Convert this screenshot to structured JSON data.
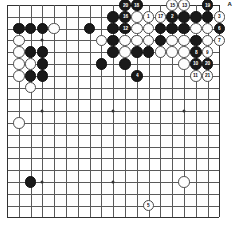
{
  "diagram": {
    "type": "go-board",
    "size": 19,
    "board_color": "#ffffff",
    "line_color": "#5a5a5a",
    "black_color": "#1a1a1a",
    "white_color": "#fdfdfd",
    "geometry": {
      "left": 7,
      "top": 5,
      "cell": 11.8,
      "stone_diameter": 11.6
    },
    "hoshi": [
      {
        "col": 3,
        "row": 3
      },
      {
        "col": 9,
        "row": 3
      },
      {
        "col": 15,
        "row": 3
      },
      {
        "col": 3,
        "row": 9
      },
      {
        "col": 9,
        "row": 9
      },
      {
        "col": 15,
        "row": 9
      },
      {
        "col": 3,
        "row": 15
      },
      {
        "col": 9,
        "row": 15
      },
      {
        "col": 15,
        "row": 15
      }
    ],
    "labels": [
      {
        "text": "A",
        "col": 18,
        "row": 0,
        "offset_x": 8,
        "offset_y": -1,
        "name": "point-label-a"
      }
    ],
    "stones": [
      {
        "col": 10,
        "row": 0,
        "color": "black",
        "number": "20"
      },
      {
        "col": 11,
        "row": 0,
        "color": "black",
        "number": "18"
      },
      {
        "col": 14,
        "row": 0,
        "color": "white",
        "number": "15"
      },
      {
        "col": 15,
        "row": 0,
        "color": "white",
        "number": "13"
      },
      {
        "col": 17,
        "row": 0,
        "color": "black",
        "number": "19"
      },
      {
        "col": 9,
        "row": 1,
        "color": "black",
        "number": ""
      },
      {
        "col": 10,
        "row": 1,
        "color": "black",
        "number": "16"
      },
      {
        "col": 11,
        "row": 1,
        "color": "white",
        "number": ""
      },
      {
        "col": 12,
        "row": 1,
        "color": "white",
        "number": "1"
      },
      {
        "col": 13,
        "row": 1,
        "color": "white",
        "number": "17"
      },
      {
        "col": 14,
        "row": 1,
        "color": "black",
        "number": "2"
      },
      {
        "col": 15,
        "row": 1,
        "color": "black",
        "number": ""
      },
      {
        "col": 16,
        "row": 1,
        "color": "black",
        "number": ""
      },
      {
        "col": 17,
        "row": 1,
        "color": "black",
        "number": ""
      },
      {
        "col": 18,
        "row": 1,
        "color": "white",
        "number": "3"
      },
      {
        "col": 9,
        "row": 2,
        "color": "black",
        "number": ""
      },
      {
        "col": 10,
        "row": 2,
        "color": "black",
        "number": "12"
      },
      {
        "col": 11,
        "row": 2,
        "color": "white",
        "number": ""
      },
      {
        "col": 12,
        "row": 2,
        "color": "white",
        "number": ""
      },
      {
        "col": 13,
        "row": 2,
        "color": "black",
        "number": ""
      },
      {
        "col": 14,
        "row": 2,
        "color": "black",
        "number": ""
      },
      {
        "col": 15,
        "row": 2,
        "color": "black",
        "number": ""
      },
      {
        "col": 16,
        "row": 2,
        "color": "white",
        "number": ""
      },
      {
        "col": 17,
        "row": 2,
        "color": "white",
        "number": ""
      },
      {
        "col": 18,
        "row": 2,
        "color": "black",
        "number": "6"
      },
      {
        "col": 8,
        "row": 3,
        "color": "white",
        "number": ""
      },
      {
        "col": 9,
        "row": 3,
        "color": "black",
        "number": ""
      },
      {
        "col": 10,
        "row": 3,
        "color": "white",
        "number": ""
      },
      {
        "col": 11,
        "row": 3,
        "color": "white",
        "number": ""
      },
      {
        "col": 12,
        "row": 3,
        "color": "white",
        "number": ""
      },
      {
        "col": 13,
        "row": 3,
        "color": "black",
        "number": ""
      },
      {
        "col": 14,
        "row": 3,
        "color": "white",
        "number": ""
      },
      {
        "col": 15,
        "row": 3,
        "color": "white",
        "number": ""
      },
      {
        "col": 16,
        "row": 3,
        "color": "black",
        "number": ""
      },
      {
        "col": 17,
        "row": 3,
        "color": "white",
        "number": ""
      },
      {
        "col": 18,
        "row": 3,
        "color": "white",
        "number": "7"
      },
      {
        "col": 9,
        "row": 4,
        "color": "black",
        "number": ""
      },
      {
        "col": 10,
        "row": 4,
        "color": "white",
        "number": ""
      },
      {
        "col": 11,
        "row": 4,
        "color": "black",
        "number": ""
      },
      {
        "col": 12,
        "row": 4,
        "color": "black",
        "number": ""
      },
      {
        "col": 13,
        "row": 4,
        "color": "white",
        "number": ""
      },
      {
        "col": 14,
        "row": 4,
        "color": "white",
        "number": ""
      },
      {
        "col": 15,
        "row": 4,
        "color": "white",
        "number": ""
      },
      {
        "col": 16,
        "row": 4,
        "color": "black",
        "number": "8"
      },
      {
        "col": 17,
        "row": 4,
        "color": "white",
        "number": "9"
      },
      {
        "col": 8,
        "row": 5,
        "color": "black",
        "number": ""
      },
      {
        "col": 10,
        "row": 5,
        "color": "black",
        "number": ""
      },
      {
        "col": 15,
        "row": 5,
        "color": "white",
        "number": ""
      },
      {
        "col": 16,
        "row": 5,
        "color": "black",
        "number": "10"
      },
      {
        "col": 17,
        "row": 5,
        "color": "black",
        "number": "20"
      },
      {
        "col": 11,
        "row": 6,
        "color": "black",
        "number": "4"
      },
      {
        "col": 16,
        "row": 6,
        "color": "white",
        "number": "11"
      },
      {
        "col": 17,
        "row": 6,
        "color": "white",
        "number": "21"
      },
      {
        "col": 1,
        "row": 2,
        "color": "black",
        "number": ""
      },
      {
        "col": 2,
        "row": 2,
        "color": "black",
        "number": ""
      },
      {
        "col": 3,
        "row": 2,
        "color": "black",
        "number": ""
      },
      {
        "col": 4,
        "row": 2,
        "color": "white",
        "number": ""
      },
      {
        "col": 7,
        "row": 2,
        "color": "black",
        "number": ""
      },
      {
        "col": 1,
        "row": 3,
        "color": "white",
        "number": ""
      },
      {
        "col": 1,
        "row": 4,
        "color": "white",
        "number": ""
      },
      {
        "col": 2,
        "row": 4,
        "color": "black",
        "number": ""
      },
      {
        "col": 3,
        "row": 4,
        "color": "black",
        "number": ""
      },
      {
        "col": 1,
        "row": 5,
        "color": "white",
        "number": ""
      },
      {
        "col": 2,
        "row": 5,
        "color": "white",
        "number": ""
      },
      {
        "col": 3,
        "row": 5,
        "color": "black",
        "number": ""
      },
      {
        "col": 1,
        "row": 6,
        "color": "white",
        "number": ""
      },
      {
        "col": 2,
        "row": 6,
        "color": "black",
        "number": ""
      },
      {
        "col": 3,
        "row": 6,
        "color": "black",
        "number": ""
      },
      {
        "col": 2,
        "row": 7,
        "color": "white",
        "number": ""
      },
      {
        "col": 1,
        "row": 10,
        "color": "white",
        "number": ""
      },
      {
        "col": 2,
        "row": 15,
        "color": "black",
        "number": ""
      },
      {
        "col": 15,
        "row": 15,
        "color": "white",
        "number": ""
      },
      {
        "col": 12,
        "row": 17,
        "color": "white",
        "number": "5"
      }
    ]
  }
}
